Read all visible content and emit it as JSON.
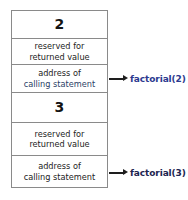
{
  "diagram": {
    "type": "call-stack-frames",
    "title": "",
    "stack_frames": [
      {
        "number": "2",
        "reserved_line1": "reserved for",
        "reserved_line2": "returned value",
        "address_line1": "address of",
        "address_line2": "calling statement",
        "callout": "factorial(2)"
      },
      {
        "number": "3",
        "reserved_line1": "reserved for",
        "reserved_line2": "returned value",
        "address_line1": "address of",
        "address_line2": "calling statement",
        "callout": "factorial(3)"
      }
    ]
  },
  "colors": {
    "border": "#8a8a8a",
    "text": "#232323",
    "number": "#141414",
    "callout_top": "#2b3a8f",
    "callout_bottom": "#1c2550",
    "arrow": "#1e1e1e"
  }
}
